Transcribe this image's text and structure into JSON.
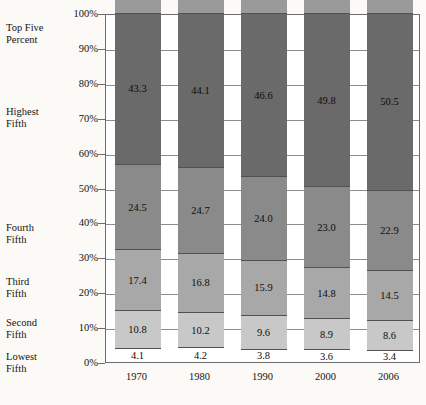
{
  "chart_data": {
    "type": "bar",
    "subtype": "stacked-bar-100-percent",
    "title": "",
    "xlabel": "",
    "ylabel": "",
    "categories": [
      "1970",
      "1980",
      "1990",
      "2000",
      "2006"
    ],
    "ylim": [
      0,
      100
    ],
    "ytick_labels": [
      "0%",
      "10%",
      "20%",
      "30%",
      "40%",
      "50%",
      "60%",
      "70%",
      "80%",
      "90%",
      "100%"
    ],
    "ytick_values": [
      0,
      10,
      20,
      30,
      40,
      50,
      60,
      70,
      80,
      90,
      100
    ],
    "grid": true,
    "legend_position": "left-axis-labels",
    "series": [
      {
        "name": "Lowest Fifth",
        "color": "#ffffff",
        "values": [
          4.1,
          4.2,
          3.8,
          3.6,
          3.4
        ]
      },
      {
        "name": "Second Fifth",
        "color": "#c8c8c8",
        "values": [
          10.8,
          10.2,
          9.6,
          8.9,
          8.6
        ]
      },
      {
        "name": "Third Fifth",
        "color": "#a8a8a8",
        "values": [
          17.4,
          16.8,
          15.9,
          14.8,
          14.5
        ]
      },
      {
        "name": "Fourth Fifth",
        "color": "#8a8a8a",
        "values": [
          24.5,
          24.7,
          24.0,
          23.0,
          22.9
        ]
      },
      {
        "name": "Highest Fifth",
        "color": "#6a6a6a",
        "values": [
          43.3,
          44.1,
          46.6,
          49.8,
          50.5
        ]
      },
      {
        "name": "Top Five Percent",
        "color": "#9a9a9a",
        "values": [
          16.6,
          16.5,
          18.5,
          22.1,
          22.3
        ]
      }
    ]
  },
  "category_labels": [
    {
      "id": "top-five-percent",
      "text": "Top Five\nPercent",
      "top": 22
    },
    {
      "id": "highest-fifth",
      "text": "Highest\nFifth",
      "top": 106
    },
    {
      "id": "fourth-fifth",
      "text": "Fourth\nFifth",
      "top": 222
    },
    {
      "id": "third-fifth",
      "text": "Third\nFifth",
      "top": 276
    },
    {
      "id": "second-fifth",
      "text": "Second\nFifth",
      "top": 317
    },
    {
      "id": "lowest-fifth",
      "text": "Lowest\nFifth",
      "top": 351
    }
  ],
  "axis": {
    "y_min_label": "0%",
    "y_max_label": "100%"
  }
}
